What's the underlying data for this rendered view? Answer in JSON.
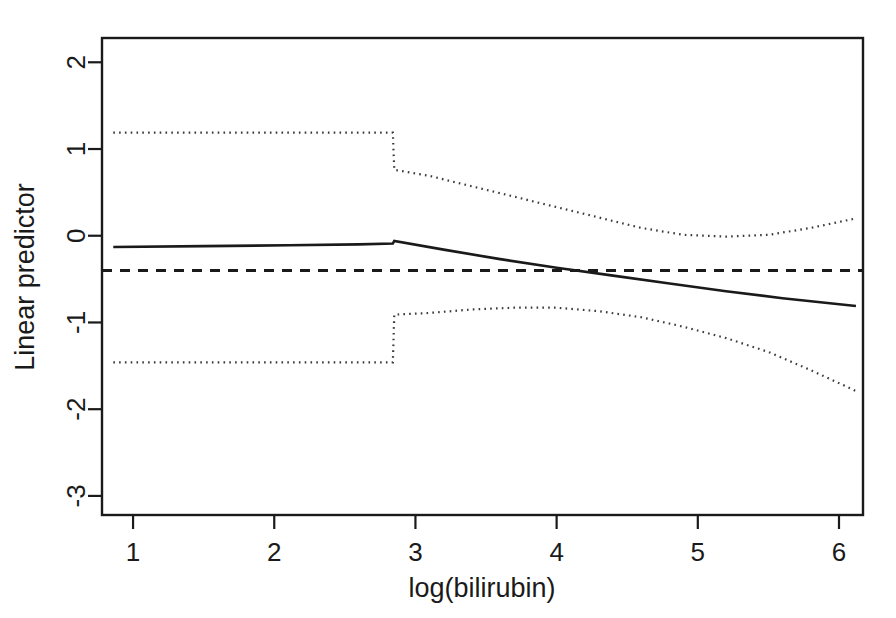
{
  "chart_data": {
    "type": "line",
    "title": "",
    "xlabel": "log(bilirubin)",
    "ylabel": "Linear predictor",
    "xlim": [
      0.78,
      6.17
    ],
    "ylim": [
      -3.22,
      2.28
    ],
    "xticks": [
      1,
      2,
      3,
      4,
      5,
      6
    ],
    "xtick_labels": [
      "1",
      "2",
      "3",
      "4",
      "5",
      "6"
    ],
    "yticks": [
      2,
      1,
      0,
      -1,
      -2,
      -3
    ],
    "ytick_labels": [
      "2",
      "1",
      "0",
      "-1",
      "-2",
      "-3"
    ],
    "grid": false,
    "legend": "none",
    "box": true,
    "series": [
      {
        "name": "fitted linear predictor",
        "style": "solid",
        "points": [
          [
            0.86,
            -0.13
          ],
          [
            1.5,
            -0.12
          ],
          [
            2.1,
            -0.11
          ],
          [
            2.6,
            -0.1
          ],
          [
            2.84,
            -0.09
          ],
          [
            2.85,
            -0.06
          ],
          [
            3.2,
            -0.16
          ],
          [
            3.6,
            -0.27
          ],
          [
            4.0,
            -0.37
          ],
          [
            4.4,
            -0.46
          ],
          [
            4.8,
            -0.55
          ],
          [
            5.2,
            -0.64
          ],
          [
            5.6,
            -0.72
          ],
          [
            6.12,
            -0.81
          ]
        ]
      },
      {
        "name": "reference level",
        "style": "dashed",
        "points": [
          [
            0.78,
            -0.4
          ],
          [
            6.17,
            -0.4
          ]
        ]
      },
      {
        "name": "upper confidence limit",
        "style": "dotted",
        "points": [
          [
            0.86,
            1.19
          ],
          [
            1.6,
            1.19
          ],
          [
            2.3,
            1.19
          ],
          [
            2.84,
            1.19
          ],
          [
            2.85,
            0.76
          ],
          [
            3.1,
            0.69
          ],
          [
            3.4,
            0.57
          ],
          [
            3.7,
            0.45
          ],
          [
            4.0,
            0.33
          ],
          [
            4.3,
            0.21
          ],
          [
            4.6,
            0.09
          ],
          [
            4.9,
            0.01
          ],
          [
            5.2,
            -0.01
          ],
          [
            5.5,
            0.01
          ],
          [
            5.8,
            0.09
          ],
          [
            6.12,
            0.2
          ]
        ]
      },
      {
        "name": "lower confidence limit",
        "style": "dotted",
        "points": [
          [
            0.86,
            -1.46
          ],
          [
            1.6,
            -1.46
          ],
          [
            2.3,
            -1.46
          ],
          [
            2.84,
            -1.46
          ],
          [
            2.85,
            -0.91
          ],
          [
            3.1,
            -0.89
          ],
          [
            3.4,
            -0.85
          ],
          [
            3.7,
            -0.83
          ],
          [
            4.0,
            -0.83
          ],
          [
            4.3,
            -0.87
          ],
          [
            4.6,
            -0.94
          ],
          [
            4.9,
            -1.05
          ],
          [
            5.2,
            -1.18
          ],
          [
            5.5,
            -1.34
          ],
          [
            5.8,
            -1.55
          ],
          [
            6.12,
            -1.79
          ]
        ]
      }
    ]
  },
  "axes": {
    "x_title": "log(bilirubin)",
    "y_title": "Linear predictor"
  }
}
